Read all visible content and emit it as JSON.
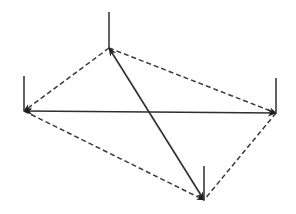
{
  "diagram": {
    "type": "graph",
    "colors": {
      "background": "#ffffff",
      "line": "#2e2e2e",
      "dashed": "#3a3a3a",
      "arrowhead": "#1e1e1e"
    },
    "nodes": [
      {
        "id": "top",
        "x": 109,
        "y": 48,
        "tick_top": 12
      },
      {
        "id": "left",
        "x": 24,
        "y": 111,
        "tick_top": 76
      },
      {
        "id": "right",
        "x": 276,
        "y": 113,
        "tick_top": 78
      },
      {
        "id": "bottom",
        "x": 204,
        "y": 200,
        "tick_top": 166
      }
    ],
    "solid_edges": [
      {
        "from": "left",
        "to": "right",
        "style": "solid",
        "arrows": "both"
      },
      {
        "from": "top",
        "to": "bottom",
        "style": "solid",
        "arrows": "both"
      }
    ],
    "dashed_edges": [
      {
        "from": "top",
        "to": "left",
        "style": "dashed",
        "arrows": "left-end"
      },
      {
        "from": "top",
        "to": "right",
        "style": "dashed",
        "arrows": "right-end"
      },
      {
        "from": "left",
        "to": "bottom",
        "style": "dashed",
        "arrows": "bottom-end"
      },
      {
        "from": "right",
        "to": "bottom",
        "style": "dashed",
        "arrows": "none"
      }
    ]
  }
}
